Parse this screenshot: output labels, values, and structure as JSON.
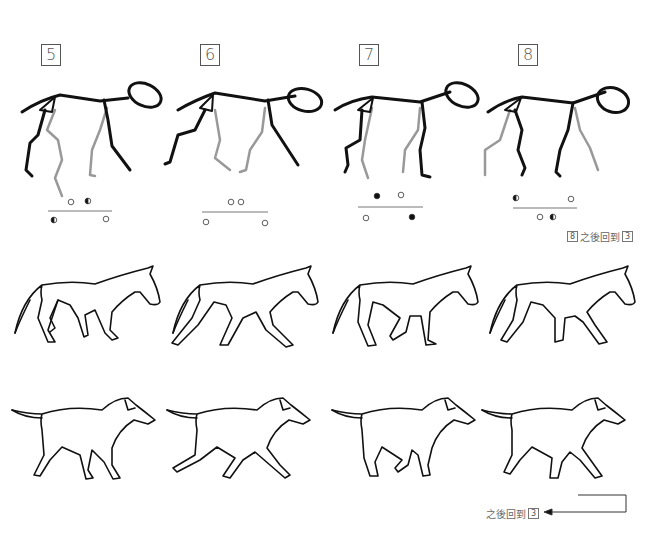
{
  "frames": [
    {
      "number": "5",
      "footfall": {
        "top": [
          "open",
          "half"
        ],
        "bottom": [
          "half",
          "open"
        ]
      }
    },
    {
      "number": "6",
      "footfall": {
        "top": [
          "open",
          "open"
        ],
        "bottom": [
          "open",
          "open"
        ]
      }
    },
    {
      "number": "7",
      "footfall": {
        "top": [
          "filled",
          "open"
        ],
        "bottom": [
          "open",
          "filled"
        ]
      }
    },
    {
      "number": "8",
      "footfall": {
        "top": [
          "half",
          "open"
        ],
        "bottom": [
          "open",
          "half"
        ]
      }
    }
  ],
  "notes": {
    "after_frame_8": {
      "from": "8",
      "text": "之後回到",
      "to": "3"
    },
    "after_sequence": {
      "text": "之後回到",
      "to": "3"
    }
  },
  "rows": {
    "skeleton": "stick-figure-gait",
    "horse": "horse-walk-cycle",
    "dog": "dog-walk-cycle"
  },
  "colors": {
    "line": "#111111",
    "ghost_leg": "#999999",
    "label": "#555555"
  }
}
